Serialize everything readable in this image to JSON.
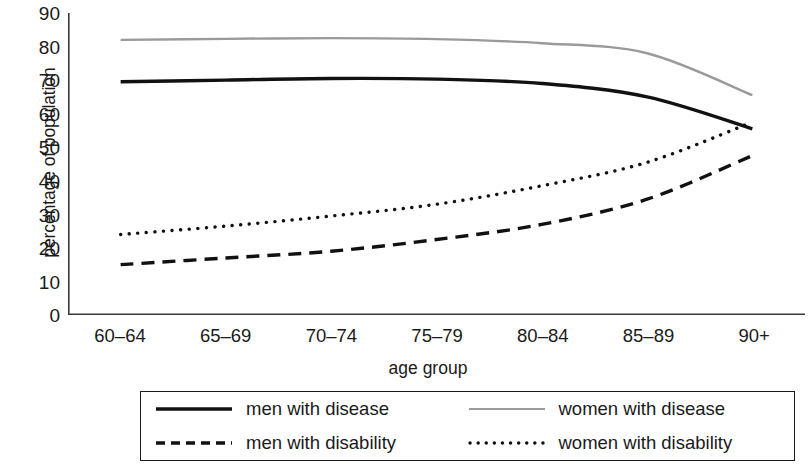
{
  "chart_data": {
    "type": "line",
    "title": "",
    "xlabel": "age group",
    "ylabel": "percentage of population",
    "categories": [
      "60–64",
      "65–69",
      "70–74",
      "75–79",
      "80–84",
      "85–89",
      "90+"
    ],
    "ylim": [
      0,
      90
    ],
    "yticks": [
      0,
      10,
      20,
      30,
      40,
      50,
      60,
      70,
      80,
      90
    ],
    "grid": false,
    "legend_position": "bottom",
    "series": [
      {
        "name": "men with disease",
        "style": "solid",
        "color": "#111111",
        "values": [
          69.5,
          70.0,
          70.5,
          70.3,
          69.0,
          65.0,
          55.5
        ]
      },
      {
        "name": "women with disease",
        "style": "solid",
        "color": "#9a9a9a",
        "values": [
          82.0,
          82.3,
          82.5,
          82.2,
          81.0,
          78.0,
          65.5
        ]
      },
      {
        "name": "men with disability",
        "style": "dashed",
        "color": "#111111",
        "values": [
          15.0,
          17.0,
          19.0,
          22.5,
          27.0,
          34.5,
          47.5
        ]
      },
      {
        "name": "women with disability",
        "style": "dotted",
        "color": "#111111",
        "values": [
          24.0,
          26.5,
          29.5,
          33.0,
          38.5,
          45.5,
          57.5
        ]
      }
    ]
  },
  "axis": {
    "line_color": "#3a3a3a"
  },
  "legend": {
    "items": [
      {
        "label": "men with disease",
        "style": "solid",
        "color": "#111111"
      },
      {
        "label": "women with disease",
        "style": "solid",
        "color": "#9a9a9a"
      },
      {
        "label": "men with disability",
        "style": "dashed",
        "color": "#111111"
      },
      {
        "label": "women with disability",
        "style": "dotted",
        "color": "#111111"
      }
    ]
  }
}
